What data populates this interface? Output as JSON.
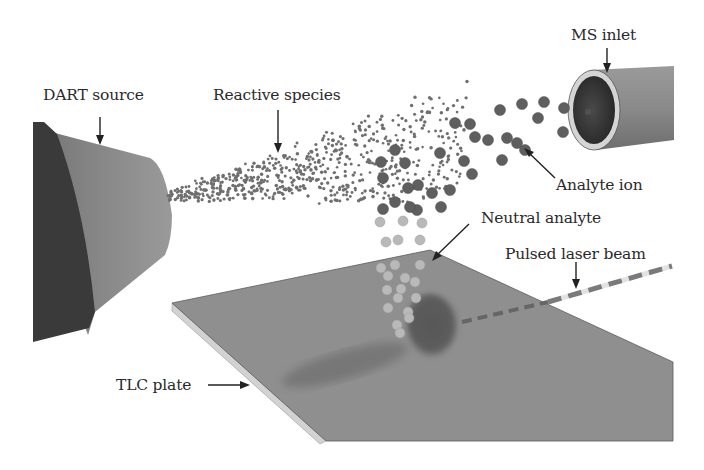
{
  "diagram": {
    "labels": {
      "dart_source": "DART source",
      "reactive_species": "Reactive species",
      "ms_inlet": "MS inlet",
      "analyte_ion": "Analyte ion",
      "neutral_analyte": "Neutral analyte",
      "pulsed_laser_beam": "Pulsed laser beam",
      "tlc_plate": "TLC plate"
    },
    "colors": {
      "background": "#ffffff",
      "dart_front_face": "#3b3b3b",
      "dart_body": "#8a8a8a",
      "reactive_species": "#6f6f6f",
      "analyte_ion": "#5f5f5f",
      "neutral_analyte": "#b9b9b9",
      "tlc_plate_surface": "#8e8e8e",
      "tlc_plate_edge": "#cfcfcf",
      "analyte_spot": "#5a5a5a",
      "laser_dash": "#707070",
      "ms_inlet_body": "#8c8c8c",
      "ms_inlet_bore": "#2e2e2e",
      "ms_inlet_rim": "#d6d6d6",
      "text": "#2a2a2a"
    }
  }
}
